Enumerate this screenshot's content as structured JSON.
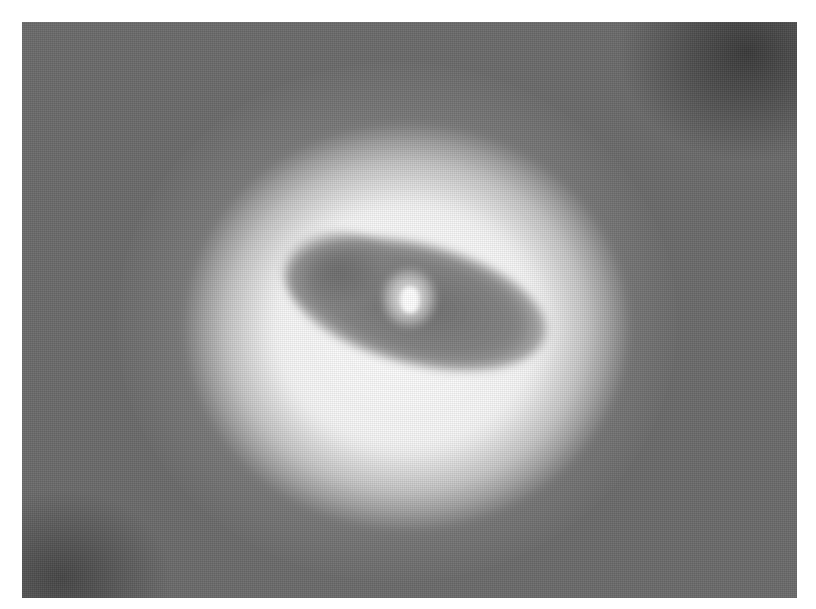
{
  "image": {
    "kind": "grayscale photograph",
    "subject": "bright diffuse halo around a tilted dark elliptical region with a bright central point source",
    "frame": {
      "x": 22,
      "y": 22,
      "width": 775,
      "height": 576
    },
    "colors": {
      "page_background": "#ffffff",
      "image_background": "#6b6b6b",
      "corner_shadow": "#444444",
      "halo": "#ffffff",
      "dark_region": "#7a7a7a",
      "core": "#ffffff"
    },
    "features": [
      {
        "name": "outer-glow",
        "center": [
          405,
          320
        ],
        "radius": [
          280,
          260
        ]
      },
      {
        "name": "bright-halo",
        "center": [
          405,
          320
        ],
        "radius": [
          210,
          190
        ]
      },
      {
        "name": "dark-ellipse",
        "center": [
          415,
          305
        ],
        "radius": [
          130,
          60
        ],
        "rotation_deg": 14
      },
      {
        "name": "bright-core",
        "center": [
          410,
          300
        ]
      }
    ]
  }
}
